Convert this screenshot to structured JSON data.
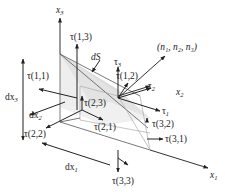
{
  "figure": {
    "type": "stress tetrahedron diagram",
    "axes": {
      "x1": {
        "label": "x",
        "sub": "1"
      },
      "x2": {
        "label": "x",
        "sub": "2"
      },
      "x3": {
        "label": "x",
        "sub": "3"
      }
    },
    "normal_label": "(n₁, n₂, n₃)",
    "surface_label": "dS",
    "differentials": {
      "dx1": {
        "label": "dx",
        "sub": "1"
      },
      "dx2": {
        "label": "dx",
        "sub": "2"
      },
      "dx3": {
        "label": "dx",
        "sub": "3"
      }
    },
    "traction_components": {
      "t1": {
        "label": "τ",
        "sub": "1"
      },
      "t2": {
        "label": "τ",
        "sub": "2"
      },
      "t3": {
        "label": "τ",
        "sub": "3"
      }
    },
    "stress_labels": {
      "s11": "τ(1,1)",
      "s12": "τ(1,2)",
      "s13": "τ(1,3)",
      "s21": "τ(2,1)",
      "s22": "τ(2,2)",
      "s23": "τ(2,3)",
      "s31": "τ(3,1)",
      "s32": "τ(3,2)",
      "s33": "τ(3,3)"
    },
    "colors": {
      "face_fill": "#e6e6e6",
      "line": "#333333",
      "background": "#ffffff"
    }
  }
}
